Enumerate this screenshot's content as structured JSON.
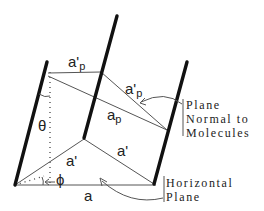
{
  "diagram": {
    "labels": {
      "a_prime_p_top": "a'",
      "a_prime_p_top_sub": "p",
      "a_prime_p_diag": "a'",
      "a_prime_p_diag_sub": "p",
      "a_p": "a",
      "a_p_sub": "p",
      "a_prime_left": "a'",
      "a_prime_right": "a'",
      "a": "a",
      "theta": "θ",
      "phi": "ϕ"
    },
    "annotations": {
      "plane_normal": [
        "Plane",
        "Normal to",
        "Molecules"
      ],
      "horizontal_plane": [
        "Horizontal",
        "Plane"
      ]
    },
    "colors": {
      "rods": "#111111",
      "lines": "#555555",
      "text": "#222222"
    }
  }
}
